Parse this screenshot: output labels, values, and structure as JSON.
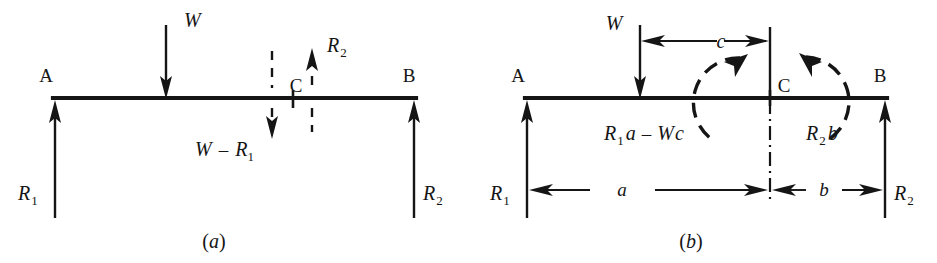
{
  "figure": {
    "background_color": "#ffffff",
    "ink_color": "#151515",
    "width": 937,
    "height": 263
  },
  "panel_a": {
    "caption": "(a)",
    "caption_open": "(",
    "caption_letter": "a",
    "caption_close": ")",
    "support_left_label": "A",
    "support_right_label": "B",
    "section_label": "C",
    "load_label": "W",
    "reaction_left": "R",
    "reaction_left_sub": "1",
    "reaction_right": "R",
    "reaction_right_sub": "2",
    "shear_label_lead": "W",
    "shear_label_minus": "–",
    "shear_label_term": "R",
    "shear_label_term_sub": "1",
    "cut_reaction_label": "R",
    "cut_reaction_label_sub": "2"
  },
  "panel_b": {
    "caption": "(b)",
    "caption_open": "(",
    "caption_letter": "b",
    "caption_close": ")",
    "support_left_label": "A",
    "support_right_label": "B",
    "section_label": "C",
    "load_label": "W",
    "reaction_left": "R",
    "reaction_left_sub": "1",
    "reaction_right": "R",
    "reaction_right_sub": "2",
    "dim_a": "a",
    "dim_b": "b",
    "dim_c": "c",
    "moment_left_r": "R",
    "moment_left_r_sub": "1",
    "moment_left_a": "a",
    "moment_left_minus": "–",
    "moment_left_w": "W",
    "moment_left_c": "c",
    "moment_right_r": "R",
    "moment_right_r_sub": "2",
    "moment_right_b": "b"
  }
}
